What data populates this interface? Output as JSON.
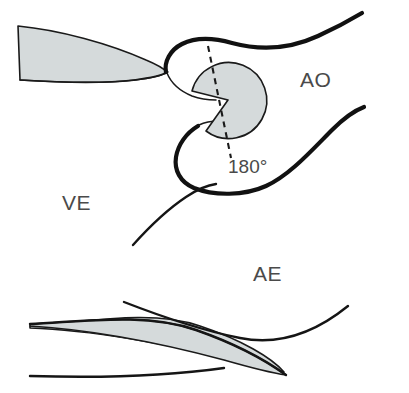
{
  "figure": {
    "background_color": "#ffffff",
    "width": 409,
    "height": 393,
    "colors": {
      "leaflet_fill": "#d5dadb",
      "outline_dark": "#111111",
      "outline_thin": "#1a1a1a",
      "label_text": "#4a4a4a"
    },
    "labels": [
      {
        "id": "ao",
        "text": "AO",
        "x": 300,
        "y": 87,
        "description": "aorta"
      },
      {
        "id": "ve",
        "text": "VE",
        "x": 62,
        "y": 210,
        "description": "ventricle"
      },
      {
        "id": "ae",
        "text": "AE",
        "x": 253,
        "y": 281,
        "description": "anterior leaflet region"
      }
    ],
    "annotations": [
      {
        "id": "angle",
        "text": "180°",
        "x": 228,
        "y": 173,
        "description": "rotation angle of the gray occluder disc"
      }
    ],
    "shapes": {
      "upper_leaflet": {
        "name": "upper-left-leaflet",
        "fill": "#d5dadb",
        "description": "tapering wedge leaflet extending from left edge to the valve orifice"
      },
      "lower_leaflet": {
        "name": "lower-left-leaflet",
        "fill": "#d5dadb",
        "description": "curved band leaflet across the bottom of the figure"
      },
      "occluder_disc": {
        "name": "occluder-disc",
        "fill": "#d5dadb",
        "description": "circular disc with a wedge notch cut from its left side",
        "center_x": 228,
        "center_y": 100,
        "radius": 38
      },
      "axis_line": {
        "name": "disc-axis-dashed-line",
        "style": "dashed",
        "x1": 208,
        "y1": 46,
        "x2": 231,
        "y2": 158
      }
    }
  }
}
